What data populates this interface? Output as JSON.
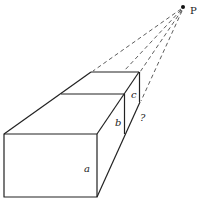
{
  "diagram": {
    "type": "perspective-box",
    "point": {
      "label": "P",
      "x": 183,
      "y": 7
    },
    "labels": {
      "a": "a",
      "b": "b",
      "c": "c",
      "unknown": "?"
    },
    "colors": {
      "stroke": "#222222",
      "background": "#ffffff"
    }
  }
}
